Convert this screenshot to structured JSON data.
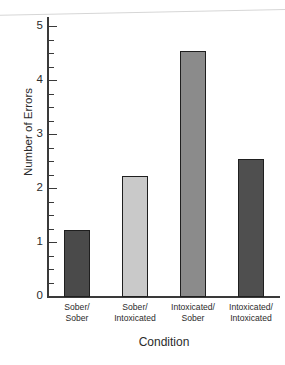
{
  "chart_data": {
    "type": "bar",
    "title": "",
    "subtitle": "",
    "xlabel": "Condition",
    "ylabel": "Number of Errors",
    "categories": [
      "Sober/\nSober",
      "Sober/\nIntoxicated",
      "Intoxicated/\nSober",
      "Intoxicated/\nIntoxicated"
    ],
    "category_lines": [
      [
        "Sober/",
        "Sober"
      ],
      [
        "Sober/",
        "Intoxicated"
      ],
      [
        "Intoxicated/",
        "Sober"
      ],
      [
        "Intoxicated/",
        "Intoxicated"
      ]
    ],
    "values": [
      1.25,
      2.25,
      4.55,
      2.55
    ],
    "bar_colors": [
      "#4a4a4a",
      "#c9c9c9",
      "#8b8b8b",
      "#4f4f4f"
    ],
    "bar_edge_color": "#1f1f1f",
    "ylim": [
      0,
      5.15
    ],
    "xlim": [
      0,
      4
    ],
    "ytick_labels": [
      "0",
      "1",
      "2",
      "3",
      "4",
      "5"
    ],
    "ytick_values": [
      0,
      1,
      2,
      3,
      4,
      5
    ],
    "yminor_tick_values": [
      0.25,
      0.5,
      0.75,
      1.25,
      1.5,
      1.75,
      2.25,
      2.5,
      2.75,
      3.25,
      3.5,
      3.75,
      4.25,
      4.5,
      4.75
    ],
    "grid": false,
    "legend": null,
    "legend_position": "none",
    "annotations": []
  },
  "axes": {
    "y_title": "Number of Errors",
    "x_title": "Condition"
  },
  "colors": {
    "axis": "#3a3a3a",
    "text": "#2b2b2b",
    "background": "#ffffff",
    "bar_edge": "#1f1f1f"
  }
}
